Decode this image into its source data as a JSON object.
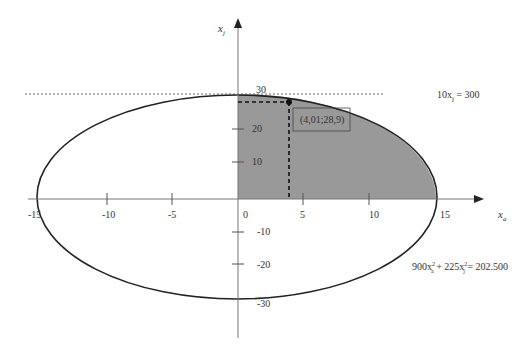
{
  "axes": {
    "x_label": "x",
    "x_sub": "a",
    "y_label": "x",
    "y_sub": "j",
    "x_ticks": [
      {
        "label": "-15",
        "value": -15
      },
      {
        "label": "-10",
        "value": -10
      },
      {
        "label": "-5",
        "value": -5
      },
      {
        "label": "0",
        "value": 0
      },
      {
        "label": "5",
        "value": 5
      },
      {
        "label": "10",
        "value": 10
      },
      {
        "label": "15",
        "value": 15
      }
    ],
    "y_ticks": [
      {
        "label": "30",
        "value": 30
      },
      {
        "label": "20",
        "value": 20
      },
      {
        "label": "10",
        "value": 10
      },
      {
        "label": "-10",
        "value": -10
      },
      {
        "label": "-20",
        "value": -20
      },
      {
        "label": "-30",
        "value": -30
      }
    ]
  },
  "annotations": {
    "constraint_line": "10x",
    "constraint_sub": "j",
    "constraint_rhs": " = 300",
    "ellipse_eq_a": "900x",
    "ellipse_sub_a": "a",
    "ellipse_mid": " + 225x",
    "ellipse_sub_j": "j",
    "ellipse_rhs": " = 202.500",
    "sup2": "2",
    "point_label": "(4,01;28,9)"
  },
  "colors": {
    "shade": "#999999",
    "axis": "#555555",
    "curve": "#222222"
  }
}
